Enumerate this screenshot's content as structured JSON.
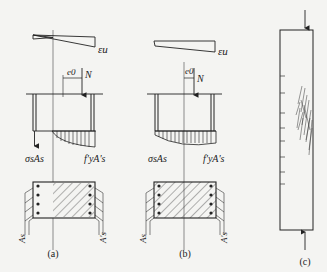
{
  "figure": {
    "panels": [
      {
        "id": "a",
        "caption": "(a)",
        "strain_label": "εu",
        "eccentricity_label": "e0",
        "axial_label": "N",
        "steel_tension_label": "σsAs",
        "steel_compression_label": "f'yA's",
        "section_left_label": "As",
        "section_right_label": "A's"
      },
      {
        "id": "b",
        "caption": "(b)",
        "strain_label": "εu",
        "eccentricity_label": "e0",
        "axial_label": "N",
        "steel_tension_label": "σsAs",
        "steel_compression_label": "f'yA's",
        "section_left_label": "As",
        "section_right_label": "A's"
      },
      {
        "id": "c",
        "caption": "(c)"
      }
    ]
  },
  "colors": {
    "ink": "#222222",
    "paper": "#f4f4f2",
    "bleed_text": "#dcdcda"
  }
}
